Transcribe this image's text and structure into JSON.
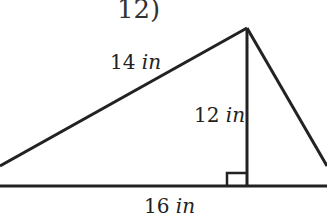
{
  "problem_number": "12)",
  "labels": {
    "hypotenuse_left": {
      "value": "14",
      "unit": "in"
    },
    "height": {
      "value": "12",
      "unit": "in"
    },
    "base": {
      "value": "16",
      "unit": "in"
    }
  },
  "colors": {
    "stroke": "#222222",
    "background": "#ffffff"
  }
}
